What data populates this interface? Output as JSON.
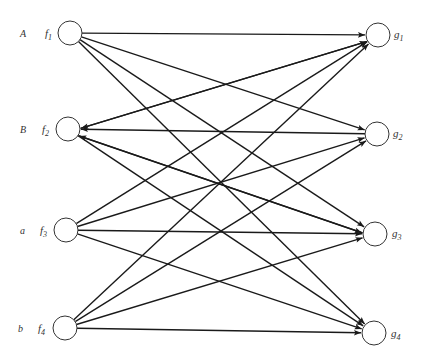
{
  "diagram": {
    "type": "bipartite-directed-graph",
    "left_nodes": [
      {
        "id": "f1",
        "name": "f",
        "sub": "1",
        "row_label": "A"
      },
      {
        "id": "f2",
        "name": "f",
        "sub": "2",
        "row_label": "B"
      },
      {
        "id": "f3",
        "name": "f",
        "sub": "3",
        "row_label": "a"
      },
      {
        "id": "f4",
        "name": "f",
        "sub": "4",
        "row_label": "b"
      }
    ],
    "right_nodes": [
      {
        "id": "g1",
        "name": "g",
        "sub": "1"
      },
      {
        "id": "g2",
        "name": "g",
        "sub": "2"
      },
      {
        "id": "g3",
        "name": "g",
        "sub": "3"
      },
      {
        "id": "g4",
        "name": "g",
        "sub": "4"
      }
    ],
    "edges": [
      {
        "from": "f1",
        "to": "g1"
      },
      {
        "from": "f1",
        "to": "g2"
      },
      {
        "from": "f1",
        "to": "g3"
      },
      {
        "from": "f1",
        "to": "g4"
      },
      {
        "from": "g1",
        "to": "f2"
      },
      {
        "from": "f2",
        "to": "g1"
      },
      {
        "from": "g2",
        "to": "f2"
      },
      {
        "from": "g3",
        "to": "f2"
      },
      {
        "from": "f2",
        "to": "g3"
      },
      {
        "from": "f2",
        "to": "g4"
      },
      {
        "from": "f3",
        "to": "g1"
      },
      {
        "from": "f3",
        "to": "g2"
      },
      {
        "from": "f3",
        "to": "g3"
      },
      {
        "from": "f3",
        "to": "g4"
      },
      {
        "from": "f4",
        "to": "g1"
      },
      {
        "from": "f4",
        "to": "g2"
      },
      {
        "from": "f4",
        "to": "g3"
      },
      {
        "from": "f4",
        "to": "g4"
      }
    ]
  }
}
